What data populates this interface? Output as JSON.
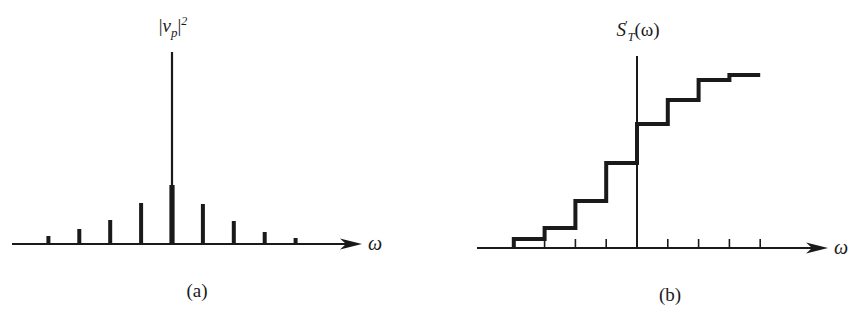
{
  "figure": {
    "ink_color": "#1a1a1a",
    "background": "#ffffff"
  },
  "panel_a": {
    "caption": "(a)",
    "y_label": {
      "bar_open": "|",
      "symbol": "v",
      "subscript": "p",
      "bar_close": "|",
      "superscript": "2",
      "full_text": "|v_p|^2"
    },
    "x_label": "ω"
  },
  "panel_b": {
    "caption": "(b)",
    "y_label": {
      "symbol": "S",
      "prime": "′",
      "subscript": "T",
      "argument": "(ω)",
      "full_text": "S'_T(ω)"
    },
    "x_label": "ω"
  },
  "chart_data": [
    {
      "type": "bar",
      "panel": "a",
      "title": "",
      "ylabel": "|v_p|^2",
      "xlabel": "ω",
      "description": "Discrete line spectrum: stem plot of |v_p|^2 vs frequency, symmetric around center with one dominant central spike",
      "categories": [
        -4,
        -3,
        -2,
        -1,
        0,
        1,
        2,
        3,
        4
      ],
      "values": [
        8,
        15,
        24,
        41,
        192,
        40,
        23,
        12,
        6
      ],
      "central_thick_part_height": 59,
      "units": "relative pixel height",
      "grid": false,
      "axis_arrow": true,
      "legend": null
    },
    {
      "type": "line",
      "step": true,
      "panel": "b",
      "title": "",
      "ylabel": "S'_T(ω)",
      "xlabel": "ω",
      "description": "Cumulative spectrum staircase: integrated spectrum with jumps at each spectral line",
      "x": [
        -4,
        -3,
        -2,
        -1,
        0,
        1,
        2,
        3,
        4
      ],
      "values": [
        9,
        20,
        47,
        85,
        124,
        148,
        168,
        173,
        173
      ],
      "step_edges": [
        -4,
        -3,
        -2,
        -1,
        0,
        1,
        2,
        3,
        4
      ],
      "tick_positions": [
        -4,
        -3,
        -2,
        -1,
        0,
        1,
        2,
        3,
        4
      ],
      "units": "relative pixel height",
      "grid": false,
      "axis_arrow": true,
      "legend": null
    }
  ]
}
